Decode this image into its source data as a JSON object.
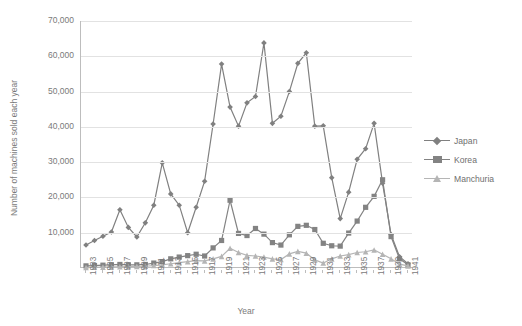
{
  "chart_data": {
    "type": "line",
    "title": "",
    "xlabel": "Year",
    "ylabel": "Number of machines sold each year",
    "ylim": [
      0,
      70000
    ],
    "ytick_labels": [
      "70,000",
      "60,000",
      "50,000",
      "40,000",
      "30,000",
      "20,000",
      "10,000",
      "0"
    ],
    "ytick_values": [
      70000,
      60000,
      50000,
      40000,
      30000,
      20000,
      10000,
      0
    ],
    "grid": true,
    "legend_position": "right",
    "x": [
      1903,
      1904,
      1905,
      1906,
      1907,
      1908,
      1909,
      1910,
      1911,
      1912,
      1913,
      1914,
      1915,
      1916,
      1917,
      1918,
      1919,
      1920,
      1921,
      1922,
      1923,
      1924,
      1925,
      1926,
      1927,
      1928,
      1929,
      1930,
      1931,
      1932,
      1933,
      1934,
      1935,
      1936,
      1937,
      1938,
      1939,
      1940,
      1941
    ],
    "xtick_labels": [
      "1903",
      "1905",
      "1907",
      "1909",
      "1911",
      "1913",
      "1915",
      "1917",
      "1919",
      "1921",
      "1923",
      "1925",
      "1927",
      "1929",
      "1931",
      "1933",
      "1935",
      "1937",
      "1939",
      "1941"
    ],
    "series": [
      {
        "name": "Japan",
        "marker": "diamond",
        "color": "#808080",
        "values": [
          6500,
          7800,
          9000,
          10200,
          16500,
          11500,
          8800,
          12800,
          17800,
          29800,
          21000,
          17800,
          10000,
          17200,
          24600,
          40800,
          57800,
          45600,
          40200,
          46800,
          48600,
          63800,
          41000,
          43000,
          50000,
          58000,
          61000,
          40200,
          40300,
          25600,
          14000,
          21500,
          30800,
          33800,
          41000,
          24000,
          9500,
          3200,
          1200
        ]
      },
      {
        "name": "Korea",
        "marker": "square",
        "color": "#838383",
        "values": [
          600,
          700,
          800,
          900,
          1000,
          900,
          900,
          1000,
          1400,
          1800,
          2600,
          3100,
          3500,
          3900,
          3400,
          5700,
          7800,
          19200,
          9800,
          9200,
          11200,
          9600,
          7200,
          6500,
          9400,
          11800,
          12100,
          10900,
          7000,
          6300,
          6200,
          9900,
          13300,
          17200,
          20300,
          25000,
          8900,
          2600,
          900
        ]
      },
      {
        "name": "Manchuria",
        "marker": "triangle",
        "color": "#b5b5b5",
        "values": [
          150,
          200,
          250,
          300,
          350,
          400,
          450,
          500,
          700,
          900,
          1200,
          1500,
          1800,
          2100,
          2000,
          2600,
          3300,
          5600,
          4400,
          3600,
          3400,
          3100,
          2600,
          2400,
          4000,
          4700,
          4200,
          2300,
          1400,
          2600,
          3400,
          3800,
          4400,
          4600,
          5100,
          3900,
          2600,
          1100,
          600
        ]
      }
    ]
  },
  "legend": {
    "items": [
      {
        "label": "Japan"
      },
      {
        "label": "Korea"
      },
      {
        "label": "Manchuria"
      }
    ]
  },
  "axes": {
    "y_title": "Number of machines sold each year",
    "x_title": "Year"
  }
}
